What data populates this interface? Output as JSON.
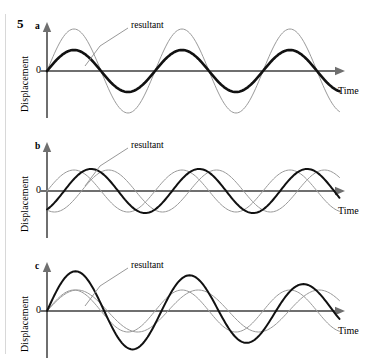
{
  "figure": {
    "number": "5",
    "left_rule": true,
    "background": "#ffffff",
    "colors": {
      "axis": "#6f6f6f",
      "source_wave": "#9a9a9a",
      "resultant_wave": "#111111",
      "text": "#1a1a1a",
      "leader_line": "#8c8c8c",
      "rule": "#d8d8d8"
    }
  },
  "panels": [
    {
      "letter": "a",
      "ylabel": "Displacement",
      "xlabel": "Time",
      "zero_label": "0",
      "callout": "resultant",
      "callout_target": "thin-gray-large-amplitude-wave"
    },
    {
      "letter": "b",
      "ylabel": "Displacement",
      "xlabel": "Time",
      "zero_label": "0",
      "callout": "resultant",
      "callout_target": "thin-gray-large-amplitude-wave"
    },
    {
      "letter": "c",
      "ylabel": "Displacement",
      "xlabel": "Time",
      "zero_label": "0",
      "callout": "resultant",
      "callout_target": "thin-gray-large-amplitude-wave"
    }
  ],
  "chart_data": [
    {
      "type": "line",
      "title": "a",
      "xlabel": "Time",
      "ylabel": "Displacement",
      "annotations": [
        "resultant"
      ],
      "grid": false,
      "legend": "none",
      "xlim": [
        0,
        2.75
      ],
      "ylim": [
        -2.2,
        2.2
      ],
      "x_units": "cycles",
      "description": "Two identical waves exactly in phase; their sum is the large-amplitude resultant.",
      "series": [
        {
          "name": "wave 1 + wave 2 (coincident sources)",
          "style": "thick-black",
          "amplitude": 1.0,
          "period": 1.0,
          "phase_deg": 0,
          "color": "#111111",
          "width": 2.6
        },
        {
          "name": "resultant",
          "style": "thin-gray",
          "amplitude": 2.0,
          "period": 1.0,
          "phase_deg": 0,
          "color": "#9a9a9a",
          "width": 1.0
        }
      ]
    },
    {
      "type": "line",
      "title": "b",
      "xlabel": "Time",
      "ylabel": "Displacement",
      "annotations": [
        "resultant"
      ],
      "grid": false,
      "legend": "none",
      "xlim": [
        0,
        2.75
      ],
      "ylim": [
        -2.2,
        2.2
      ],
      "x_units": "cycles",
      "description": "Two waves of equal amplitude with a phase difference; the resultant is intermediate in amplitude and shifted in phase.",
      "series": [
        {
          "name": "wave 1",
          "style": "thin-gray",
          "amplitude": 1.0,
          "period": 1.0,
          "phase_deg": 0,
          "color": "#9a9a9a",
          "width": 1.0
        },
        {
          "name": "wave 2",
          "style": "thin-gray",
          "amplitude": 1.0,
          "period": 1.0,
          "phase_deg": 115,
          "color": "#9a9a9a",
          "width": 1.0
        },
        {
          "name": "resultant",
          "style": "thick-black",
          "amplitude": 1.05,
          "period": 1.0,
          "phase_deg": 57,
          "color": "#111111",
          "width": 2.0
        }
      ]
    },
    {
      "type": "line",
      "title": "c",
      "xlabel": "Time",
      "ylabel": "Displacement",
      "annotations": [
        "resultant"
      ],
      "grid": false,
      "legend": "none",
      "xlim": [
        0,
        2.75
      ],
      "ylim": [
        -2.2,
        2.2
      ],
      "x_units": "cycles",
      "description": "Two waves of slightly different frequency drifting out of phase; the resultant amplitude decreases across the record (beats).",
      "series": [
        {
          "name": "wave 1",
          "style": "thin-gray",
          "amplitude": 1.0,
          "period": 1.0,
          "phase_deg": 0,
          "color": "#9a9a9a",
          "width": 1.0
        },
        {
          "name": "wave 2",
          "style": "thin-gray",
          "amplitude": 1.0,
          "period": 1.12,
          "phase_deg": 0,
          "color": "#9a9a9a",
          "width": 1.0
        },
        {
          "name": "resultant",
          "style": "thick-black",
          "amplitude": 1.9,
          "period": 1.06,
          "phase_deg": 0,
          "color": "#111111",
          "width": 2.0,
          "beat_period": 9.0
        }
      ]
    }
  ]
}
